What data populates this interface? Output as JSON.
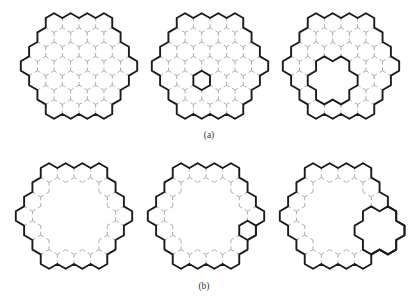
{
  "figure": {
    "hex_radius": 9.6,
    "cluster_radius": 3,
    "colors": {
      "background": "#ffffff",
      "outline": "#1c1c1c",
      "inner_edge": "#8a8a8a",
      "label": "#333333"
    },
    "rows": [
      {
        "label": "(a)",
        "label_pos": [
          209,
          138
        ],
        "panels": [
          {
            "id": "a1",
            "center": [
              79,
              66
            ],
            "fill": "disk",
            "marked_cells": [],
            "removed_flowers": [],
            "attached_flowers": []
          },
          {
            "id": "a2",
            "center": [
              210,
              66
            ],
            "fill": "disk",
            "marked_cells": [
              [
                -1,
                1
              ]
            ],
            "removed_flowers": [],
            "attached_flowers": []
          },
          {
            "id": "a3",
            "center": [
              341,
              66
            ],
            "fill": "disk",
            "marked_cells": [],
            "removed_flowers": [
              [
                -1,
                1
              ]
            ],
            "attached_flowers": []
          }
        ]
      },
      {
        "label": "(b)",
        "label_pos": [
          204,
          289
        ],
        "panels": [
          {
            "id": "b1",
            "center": [
              74,
              216
            ],
            "fill": "ring",
            "marked_cells": [],
            "removed_flowers": [],
            "attached_flowers": []
          },
          {
            "id": "b2",
            "center": [
              206,
              216
            ],
            "fill": "ring",
            "marked_cells": [
              [
                2,
                1
              ]
            ],
            "removed_flowers": [],
            "attached_flowers": []
          },
          {
            "id": "b3",
            "center": [
              338,
              216
            ],
            "fill": "ring",
            "marked_cells": [],
            "removed_flowers": [],
            "attached_flowers": [
              [
                2,
                1
              ]
            ]
          }
        ]
      }
    ]
  }
}
